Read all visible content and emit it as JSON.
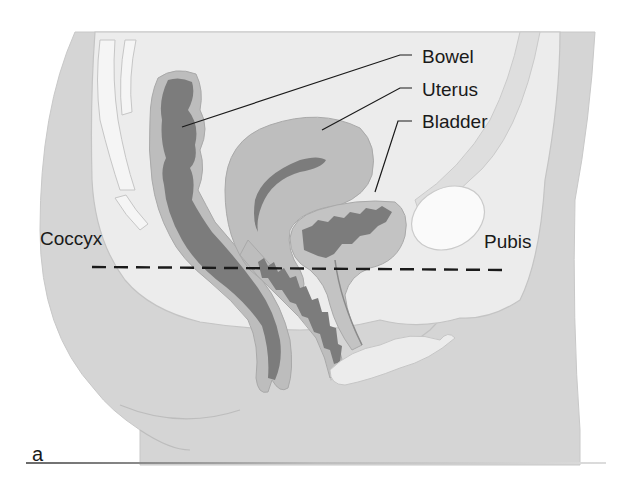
{
  "figure": {
    "panel_letter": "a",
    "labels": {
      "bowel": "Bowel",
      "uterus": "Uterus",
      "bladder": "Bladder",
      "coccyx": "Coccyx",
      "pubis": "Pubis"
    },
    "reference_line": "dashed line from coccyx to pubis",
    "colors": {
      "background": "#ffffff",
      "body_tissue": "#d6d6d6",
      "pelvic_cavity": "#ececec",
      "organ_wall": "#bdbdbd",
      "organ_lumen": "#7a7a7a",
      "bone": "#f7f7f7",
      "text": "#1a1a1a"
    }
  }
}
